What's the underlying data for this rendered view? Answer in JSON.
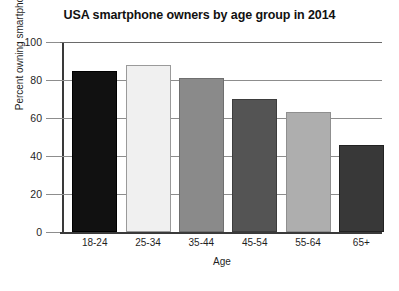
{
  "chart_data": {
    "type": "bar",
    "title": "USA smartphone owners by age group in 2014",
    "xlabel": "Age",
    "ylabel": "Percent owning smartphones",
    "categories": [
      "18-24",
      "25-34",
      "35-44",
      "45-54",
      "55-64",
      "65+"
    ],
    "values": [
      85,
      88,
      81,
      70,
      63,
      46
    ],
    "ylim": [
      0,
      100
    ],
    "yticks": [
      0,
      20,
      40,
      60,
      80,
      100
    ],
    "ytick_labels": [
      "0",
      "20",
      "40",
      "60",
      "80",
      "100"
    ],
    "grid": true,
    "legend": "none",
    "bar_colors": [
      "#111111",
      "#f0f0f0",
      "#8a8a8a",
      "#545454",
      "#aeaeae",
      "#383838"
    ],
    "bar_edge_colors": [
      "#000000",
      "#9a9a9a",
      "#6f6f6f",
      "#3d3d3d",
      "#8f8f8f",
      "#222222"
    ]
  },
  "axis_colors": {
    "grid": "#8d8d8d",
    "axis": "#3a3a3a",
    "text": "#1f1f1f",
    "title": "#111111"
  }
}
